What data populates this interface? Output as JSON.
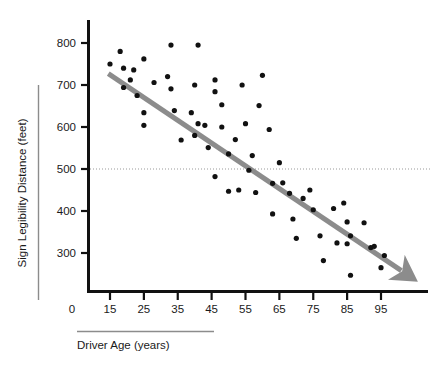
{
  "chart_data": {
    "type": "scatter",
    "title": "",
    "xlabel": "Driver Age (years)",
    "ylabel": "Sign Legibility Distance (feet)",
    "xlim": [
      10,
      102
    ],
    "ylim": [
      210,
      830
    ],
    "xticks": [
      15,
      25,
      35,
      45,
      55,
      65,
      75,
      85,
      95
    ],
    "yticks": [
      300,
      400,
      500,
      600,
      700,
      800
    ],
    "origin_label": "0",
    "grid": false,
    "legend": "none",
    "point_color": "#111111",
    "point_radius": 2.6,
    "reference_line": {
      "orientation": "horizontal",
      "value": 500,
      "style": "dotted",
      "color": "#9a9a9a"
    },
    "trend_line": {
      "style": "solid-arrow",
      "color": "#8c8c8c",
      "width": 5,
      "x_start": 14.5,
      "y_start": 727,
      "x_end": 101,
      "y_end": 258,
      "arrowhead": true
    },
    "points": [
      {
        "x": 15,
        "y": 750
      },
      {
        "x": 18,
        "y": 780
      },
      {
        "x": 19,
        "y": 740
      },
      {
        "x": 19,
        "y": 694
      },
      {
        "x": 21,
        "y": 712
      },
      {
        "x": 22,
        "y": 736
      },
      {
        "x": 23,
        "y": 675
      },
      {
        "x": 25,
        "y": 762
      },
      {
        "x": 25,
        "y": 634
      },
      {
        "x": 25,
        "y": 604
      },
      {
        "x": 28,
        "y": 706
      },
      {
        "x": 32,
        "y": 720
      },
      {
        "x": 33,
        "y": 795
      },
      {
        "x": 33,
        "y": 691
      },
      {
        "x": 34,
        "y": 639
      },
      {
        "x": 36,
        "y": 569
      },
      {
        "x": 39,
        "y": 634
      },
      {
        "x": 40,
        "y": 700
      },
      {
        "x": 40,
        "y": 580
      },
      {
        "x": 41,
        "y": 795
      },
      {
        "x": 41,
        "y": 608
      },
      {
        "x": 43,
        "y": 604
      },
      {
        "x": 44,
        "y": 551
      },
      {
        "x": 46,
        "y": 712
      },
      {
        "x": 46,
        "y": 684
      },
      {
        "x": 46,
        "y": 482
      },
      {
        "x": 48,
        "y": 653
      },
      {
        "x": 48,
        "y": 600
      },
      {
        "x": 50,
        "y": 536
      },
      {
        "x": 50,
        "y": 447
      },
      {
        "x": 52,
        "y": 570
      },
      {
        "x": 53,
        "y": 450
      },
      {
        "x": 54,
        "y": 700
      },
      {
        "x": 55,
        "y": 608
      },
      {
        "x": 56,
        "y": 497
      },
      {
        "x": 57,
        "y": 532
      },
      {
        "x": 58,
        "y": 444
      },
      {
        "x": 59,
        "y": 651
      },
      {
        "x": 60,
        "y": 723
      },
      {
        "x": 62,
        "y": 594
      },
      {
        "x": 63,
        "y": 393
      },
      {
        "x": 63,
        "y": 466
      },
      {
        "x": 65,
        "y": 515
      },
      {
        "x": 66,
        "y": 467
      },
      {
        "x": 68,
        "y": 442
      },
      {
        "x": 69,
        "y": 381
      },
      {
        "x": 70,
        "y": 335
      },
      {
        "x": 72,
        "y": 430
      },
      {
        "x": 74,
        "y": 450
      },
      {
        "x": 75,
        "y": 403
      },
      {
        "x": 77,
        "y": 341
      },
      {
        "x": 78,
        "y": 282
      },
      {
        "x": 81,
        "y": 406
      },
      {
        "x": 82,
        "y": 324
      },
      {
        "x": 84,
        "y": 419
      },
      {
        "x": 85,
        "y": 374
      },
      {
        "x": 85,
        "y": 322
      },
      {
        "x": 86,
        "y": 341
      },
      {
        "x": 86,
        "y": 247
      },
      {
        "x": 90,
        "y": 372
      },
      {
        "x": 92,
        "y": 313
      },
      {
        "x": 93,
        "y": 316
      },
      {
        "x": 95,
        "y": 265
      },
      {
        "x": 96,
        "y": 294
      }
    ]
  }
}
